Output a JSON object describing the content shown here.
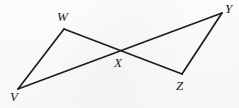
{
  "figure": {
    "canvas": {
      "width": 239,
      "height": 108
    },
    "stroke_color": "#1d1d1d",
    "background_color": "#fdfdfd",
    "label_color": "#1a1a1a",
    "points": [
      {
        "name": "V",
        "label": "V",
        "x": 18,
        "y": 89,
        "label_x": 10,
        "label_y": 90
      },
      {
        "name": "W",
        "label": "W",
        "x": 64,
        "y": 29,
        "label_x": 57,
        "label_y": 10
      },
      {
        "name": "X",
        "label": "X",
        "x": 120,
        "y": 52,
        "label_x": 114,
        "label_y": 56
      },
      {
        "name": "Y",
        "label": "Y",
        "x": 222,
        "y": 13,
        "label_x": 225,
        "label_y": 2
      },
      {
        "name": "Z",
        "label": "Z",
        "x": 182,
        "y": 74,
        "label_x": 176,
        "label_y": 79
      }
    ],
    "segments": [
      {
        "name": "segment-v-w",
        "from": "V",
        "to": "W",
        "path": "M 18 89 L 64 29"
      },
      {
        "name": "segment-w-z",
        "from": "W",
        "to": "Z",
        "path": "M 64 29 L 182 74"
      },
      {
        "name": "segment-v-y",
        "from": "V",
        "to": "Y",
        "path": "M 18 89 L 222 13"
      },
      {
        "name": "segment-y-z",
        "from": "Y",
        "to": "Z",
        "path": "M 222 13 L 182 74"
      }
    ]
  }
}
